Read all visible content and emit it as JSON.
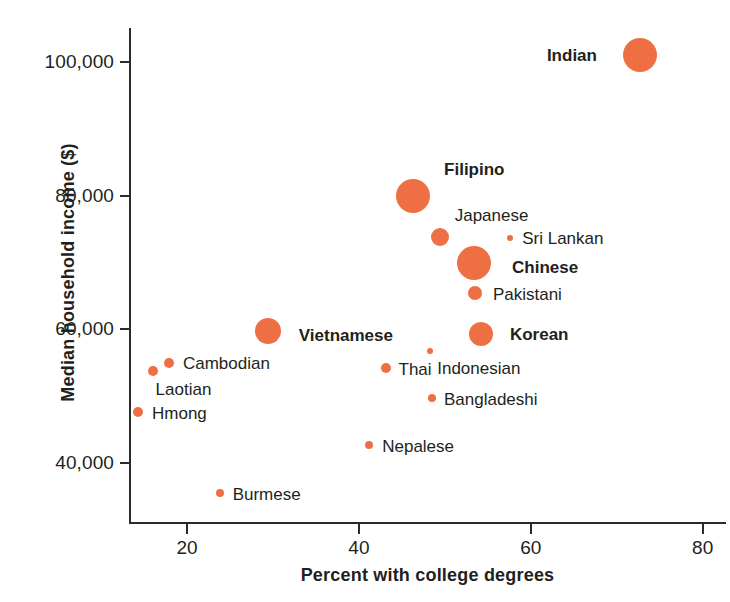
{
  "chart_data": {
    "type": "scatter",
    "title": "",
    "xlabel": "Percent with college degrees",
    "ylabel": "Median household income ($)",
    "xlim": [
      12.5,
      82.5
    ],
    "ylim": [
      33000,
      105500
    ],
    "xticks": [
      20,
      40,
      60,
      80
    ],
    "xtick_labels": [
      "20",
      "40",
      "60",
      "80"
    ],
    "yticks": [
      40000,
      60000,
      80000,
      100000
    ],
    "ytick_labels": [
      "40,000",
      "60,000",
      "80,000",
      "100,000"
    ],
    "grid": false,
    "legend": "none",
    "bubble_color": "#ef6f45",
    "axis_color": "#2b2b2b",
    "text_color": "#231f20",
    "note": "Bubble area encodes population size of each group; no size legend shown.",
    "points": [
      {
        "label": "Indian",
        "x": 72.7,
        "y": 101000,
        "r": 17,
        "bold": true,
        "label_side": "left",
        "label_dx": -26,
        "label_dy": 0
      },
      {
        "label": "Filipino",
        "x": 46.3,
        "y": 79900,
        "r": 17,
        "bold": true,
        "label_side": "right",
        "label_dx": 14,
        "label_dy": -27
      },
      {
        "label": "Japanese",
        "x": 49.4,
        "y": 73800,
        "r": 9,
        "bold": false,
        "label_side": "right",
        "label_dx": 6,
        "label_dy": -22
      },
      {
        "label": "Sri Lankan",
        "x": 57.6,
        "y": 73650,
        "r": 3,
        "bold": false,
        "label_side": "right",
        "label_dx": 9,
        "label_dy": 0
      },
      {
        "label": "Chinese",
        "x": 53.4,
        "y": 69900,
        "r": 17,
        "bold": true,
        "label_side": "right",
        "label_dx": 21,
        "label_dy": 4
      },
      {
        "label": "Pakistani",
        "x": 53.5,
        "y": 65400,
        "r": 7,
        "bold": false,
        "label_side": "right",
        "label_dx": 11,
        "label_dy": 1
      },
      {
        "label": "Korean",
        "x": 54.2,
        "y": 59300,
        "r": 12,
        "bold": true,
        "label_side": "right",
        "label_dx": 17,
        "label_dy": 0
      },
      {
        "label": "Vietnamese",
        "x": 29.4,
        "y": 59800,
        "r": 13,
        "bold": true,
        "label_side": "right",
        "label_dx": 18,
        "label_dy": 4
      },
      {
        "label": "Cambodian",
        "x": 17.9,
        "y": 55000,
        "r": 5,
        "bold": false,
        "label_side": "right",
        "label_dx": 9,
        "label_dy": 0
      },
      {
        "label": "Laotian",
        "x": 16.0,
        "y": 53800,
        "r": 5,
        "bold": false,
        "label_side": "right",
        "label_dx": -2,
        "label_dy": 18
      },
      {
        "label": "Indonesian",
        "x": 48.3,
        "y": 56800,
        "r": 3,
        "bold": false,
        "label_side": "right",
        "label_dx": 4,
        "label_dy": 17
      },
      {
        "label": "Thai",
        "x": 43.1,
        "y": 54200,
        "r": 5,
        "bold": false,
        "label_side": "right",
        "label_dx": 8,
        "label_dy": 1
      },
      {
        "label": "Hmong",
        "x": 14.3,
        "y": 47700,
        "r": 5,
        "bold": false,
        "label_side": "right",
        "label_dx": 9,
        "label_dy": 1
      },
      {
        "label": "Bangladeshi",
        "x": 48.5,
        "y": 49700,
        "r": 4,
        "bold": false,
        "label_side": "right",
        "label_dx": 8,
        "label_dy": 1
      },
      {
        "label": "Nepalese",
        "x": 41.2,
        "y": 42700,
        "r": 4,
        "bold": false,
        "label_side": "right",
        "label_dx": 9,
        "label_dy": 1
      },
      {
        "label": "Burmese",
        "x": 23.8,
        "y": 35500,
        "r": 4,
        "bold": false,
        "label_side": "right",
        "label_dx": 9,
        "label_dy": 1
      }
    ]
  }
}
